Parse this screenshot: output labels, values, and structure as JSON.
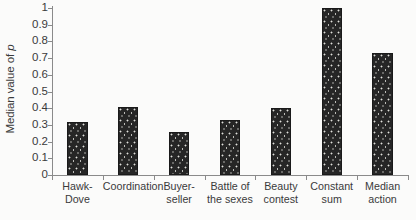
{
  "chart_data": {
    "type": "bar",
    "title": "",
    "xlabel": "",
    "ylabel": "Median value of p",
    "ylabel_prefix": "Median value of ",
    "ylabel_italic_symbol": "p",
    "categories": [
      "Hawk-Dove",
      "Coordination",
      "Buyer-seller",
      "Battle of the sexes",
      "Beauty contest",
      "Constant sum",
      "Median action"
    ],
    "category_lines": [
      [
        "Hawk-",
        "Dove"
      ],
      [
        "Coordination",
        ""
      ],
      [
        "Buyer-",
        "seller"
      ],
      [
        "Battle of",
        "the sexes"
      ],
      [
        "Beauty",
        "contest"
      ],
      [
        "Constant",
        "sum"
      ],
      [
        "Median",
        "action"
      ]
    ],
    "values": [
      0.32,
      0.41,
      0.26,
      0.33,
      0.4,
      1.0,
      0.73
    ],
    "ylim": [
      0,
      1
    ],
    "ytick_values": [
      0,
      0.1,
      0.2,
      0.3,
      0.4,
      0.5,
      0.6,
      0.7,
      0.8,
      0.9,
      1
    ],
    "ytick_labels": [
      "0",
      "0.1",
      "0.2",
      "0.3",
      "0.4",
      "0.5",
      "0.6",
      "0.7",
      "0.8",
      "0.9",
      "1"
    ],
    "grid": false,
    "legend": false,
    "bar_color": "#262626",
    "axis_color": "#8a8a8a",
    "text_color": "#3a3a3a",
    "background_color": "#fbfbfa"
  }
}
